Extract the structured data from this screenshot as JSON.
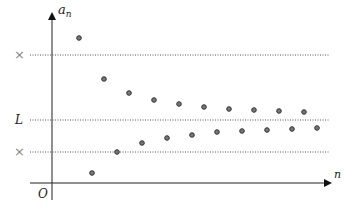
{
  "diagram": {
    "title": "",
    "axes": {
      "y_label": "a",
      "y_label_sub": "n",
      "x_label": "n",
      "origin_label": "O"
    },
    "reference_lines": [
      {
        "label": "×",
        "y_px": 55,
        "role": "upper-bound-mark"
      },
      {
        "label": "L",
        "y_px": 120,
        "role": "limit"
      },
      {
        "label": "×",
        "y_px": 152,
        "role": "lower-bound-mark"
      }
    ],
    "colors": {
      "axis": "#222222",
      "dotted_line": "#555555",
      "point_fill": "#777777",
      "point_stroke": "#333333",
      "mark": "#888888"
    }
  },
  "chart_data": {
    "type": "scatter",
    "title": "",
    "xlabel": "n",
    "ylabel": "a_n",
    "series": [
      {
        "name": "upper terms",
        "points_px": [
          [
            79,
            38
          ],
          [
            104,
            79
          ],
          [
            129,
            93
          ],
          [
            154,
            100
          ],
          [
            179,
            104
          ],
          [
            204,
            107
          ],
          [
            229,
            109
          ],
          [
            254,
            110
          ],
          [
            279,
            111
          ],
          [
            304,
            112
          ]
        ]
      },
      {
        "name": "lower terms",
        "points_px": [
          [
            92,
            173
          ],
          [
            117,
            152
          ],
          [
            142,
            143
          ],
          [
            167,
            138
          ],
          [
            192,
            135
          ],
          [
            217,
            132
          ],
          [
            242,
            131
          ],
          [
            267,
            130
          ],
          [
            292,
            129
          ],
          [
            317,
            128
          ]
        ]
      }
    ],
    "annotations": [
      "L",
      "×",
      "×",
      "O"
    ],
    "grid": false
  }
}
